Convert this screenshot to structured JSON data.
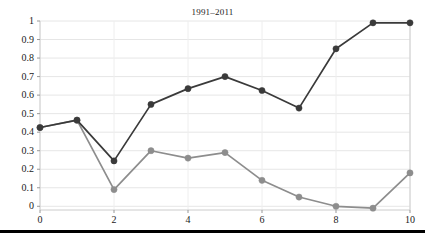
{
  "chart_data": {
    "type": "line",
    "title": "1991–2011",
    "xlabel": "",
    "ylabel": "",
    "x": [
      0,
      1,
      2,
      3,
      4,
      5,
      6,
      7,
      8,
      9,
      10
    ],
    "series": [
      {
        "name": "dark-series",
        "color": "#3a3a3a",
        "marker": "circle",
        "values": [
          0.425,
          0.465,
          0.245,
          0.55,
          0.635,
          0.7,
          0.625,
          0.53,
          0.85,
          0.99,
          0.99
        ]
      },
      {
        "name": "light-series",
        "color": "#8d8d8d",
        "marker": "circle",
        "values": [
          0.425,
          0.465,
          0.09,
          0.3,
          0.26,
          0.29,
          0.14,
          0.05,
          0.0,
          -0.01,
          0.18
        ]
      }
    ],
    "xlim": [
      0,
      10
    ],
    "ylim": [
      -0.02,
      1.0
    ],
    "xticks": [
      0,
      2,
      4,
      6,
      8,
      10
    ],
    "xticklabels": [
      "0",
      "2",
      "4",
      "6",
      "8",
      "10"
    ],
    "yticks": [
      0,
      0.1,
      0.2,
      0.3,
      0.4,
      0.5,
      0.6,
      0.7,
      0.8,
      0.9,
      1
    ],
    "yticklabels": [
      "0",
      "0.1",
      "0.2",
      "0.3",
      "0.4",
      "0.5",
      "0.6",
      "0.7",
      "0.8",
      "0.9",
      "1"
    ],
    "grid": true,
    "grid_axis": "y",
    "grid_color": "#e6e6e6",
    "legend": false,
    "legend_position": "none",
    "background_color": "#ffffff",
    "axis_color": "#cccccc"
  },
  "footer": {
    "rule_color": "#000000"
  }
}
